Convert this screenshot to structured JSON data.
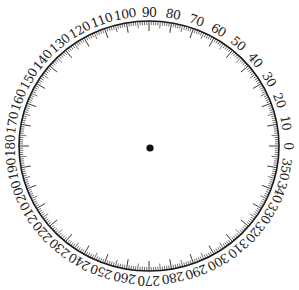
{
  "diagram": {
    "type": "degree-wheel",
    "label_values": [
      "0",
      "10",
      "20",
      "30",
      "40",
      "50",
      "60",
      "70",
      "80",
      "90",
      "100",
      "110",
      "120",
      "130",
      "140",
      "150",
      "160",
      "170",
      "180",
      "190",
      "200",
      "210",
      "220",
      "230",
      "240",
      "250",
      "260",
      "270",
      "280",
      "290",
      "300",
      "310",
      "320",
      "330",
      "340",
      "350"
    ],
    "label_step_degrees": 10,
    "minor_tick_step_degrees": 1,
    "mid_tick_step_degrees": 5,
    "direction": "counterclockwise",
    "zero_position": "right",
    "geometry": {
      "cx": 149,
      "cy": 146,
      "rx": 130,
      "ry": 125
    },
    "colors": {
      "rim": "#1a1a1a",
      "ticks": "#333333",
      "labels": "#222222",
      "center_dot": "#111111",
      "background": "#ffffff"
    }
  }
}
